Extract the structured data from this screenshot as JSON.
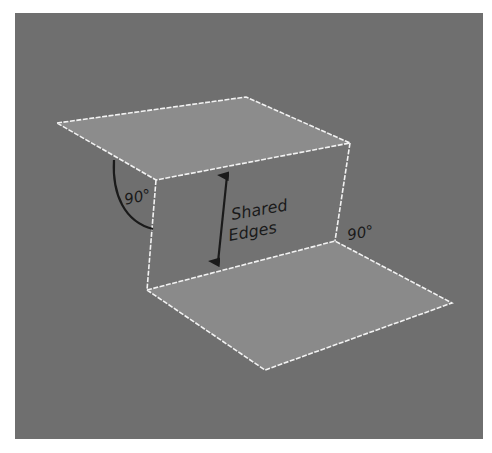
{
  "diagram": {
    "background_color": "#6f6f6f",
    "face_colors": {
      "top": "#8c8c8c",
      "vertical": "#727272",
      "bottom": "#8a8a8a"
    },
    "edge_color": "#f2f2f2",
    "label_color": "#1a1a1a",
    "labels": {
      "angle_left": "90°",
      "angle_right": "90°",
      "shared_line1": "Shared",
      "shared_line2": "Edges"
    }
  }
}
